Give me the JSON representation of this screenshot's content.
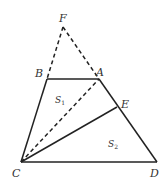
{
  "diagram": {
    "type": "geometry",
    "points": {
      "F": {
        "label": "F",
        "x": 63,
        "y": 27
      },
      "B": {
        "label": "B",
        "x": 47,
        "y": 79
      },
      "A": {
        "label": "A",
        "x": 99,
        "y": 79
      },
      "E": {
        "label": "E",
        "x": 117,
        "y": 107
      },
      "C": {
        "label": "C",
        "x": 21,
        "y": 162
      },
      "D": {
        "label": "D",
        "x": 157,
        "y": 162
      }
    },
    "solid_segments": [
      "BA",
      "CB",
      "AD",
      "CD",
      "CE"
    ],
    "dashed_segments": [
      "FB",
      "FA",
      "CA"
    ],
    "regions": [
      {
        "name": "S",
        "subscript": "1",
        "x": 55,
        "y": 103
      },
      {
        "name": "S",
        "subscript": "2",
        "x": 108,
        "y": 147
      }
    ],
    "colors": {
      "stroke": "#222222",
      "text": "#333333",
      "background": "#ffffff"
    }
  }
}
